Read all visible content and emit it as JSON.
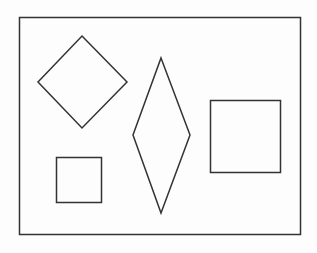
{
  "canvas": {
    "width": 317,
    "height": 253,
    "background": "#fdfdfd",
    "stroke": "#333333",
    "stroke_width": 1.5
  },
  "frame": {
    "x": 19.5,
    "y": 17.5,
    "w": 281,
    "h": 217
  },
  "shapes": [
    {
      "name": "diamond-shape",
      "type": "polygon",
      "points": "82,36 127,82 82,128 38,82"
    },
    {
      "name": "rhombus-shape",
      "type": "polygon",
      "points": "161,58 190,135 161,213 133,135"
    },
    {
      "name": "large-square-shape",
      "type": "rect",
      "x": 210.5,
      "y": 100.5,
      "w": 70,
      "h": 72
    },
    {
      "name": "small-square-shape",
      "type": "rect",
      "x": 56.5,
      "y": 157.5,
      "w": 45,
      "h": 45
    }
  ]
}
